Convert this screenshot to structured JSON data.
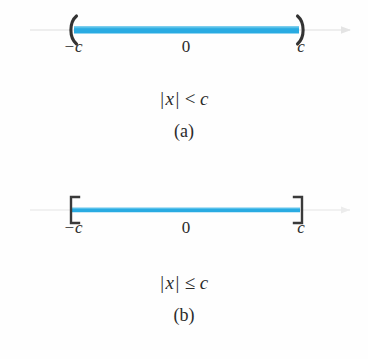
{
  "figure": {
    "background_color": "#fefefe",
    "segment_color": "#29abe2",
    "axis_color": "#e2e2e2",
    "endpoint_color": "#2b2b2b",
    "text_color": "#2b2b2b"
  },
  "panels": [
    {
      "id": "a",
      "letter": "(a)",
      "endpoint_style": "parenthesis",
      "left_endpoint_glyph": "(",
      "right_endpoint_glyph": ")",
      "segment_thickness": 7,
      "ticks": {
        "left": "−c",
        "zero": "0",
        "right": "c"
      },
      "formula": {
        "open_bar": "|",
        "variable": "x",
        "close_bar": "|",
        "relation": "<",
        "bound": "c",
        "plain": "|x| < c"
      },
      "axis_arrow": {
        "left": false,
        "right": true
      }
    },
    {
      "id": "b",
      "letter": "(b)",
      "endpoint_style": "bracket",
      "left_endpoint_glyph": "[",
      "right_endpoint_glyph": "]",
      "segment_thickness": 4,
      "ticks": {
        "left": "−c",
        "zero": "0",
        "right": "c"
      },
      "formula": {
        "open_bar": "|",
        "variable": "x",
        "close_bar": "|",
        "relation": "≤",
        "bound": "c",
        "plain": "|x| ≤ c"
      },
      "axis_arrow": {
        "left": false,
        "right": true
      }
    }
  ]
}
